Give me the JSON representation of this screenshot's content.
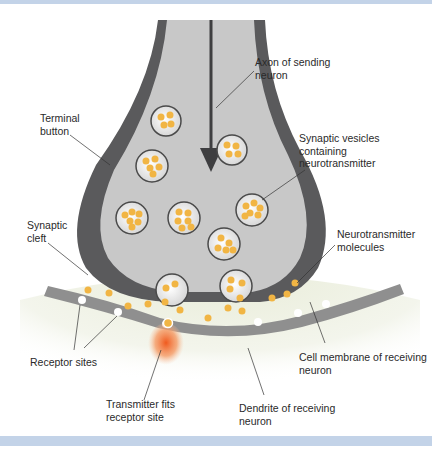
{
  "figure": {
    "colors": {
      "band": "#c3d3e8",
      "membrane_dark": "#5a5a5c",
      "cytoplasm": "#c8c8c8",
      "vesicle_fill": "#eeeeee",
      "vesicle_border": "#4a4a4a",
      "neurotransmitter": "#f1b544",
      "dendrite": "#eef1e4",
      "receiving_membrane": "#8f8f8f",
      "receptor_glow": "#f07a3a"
    }
  },
  "labels": {
    "axon": "Axon of sending\nneuron",
    "terminal_button": "Terminal\nbutton",
    "synaptic_vesicles": "Synaptic vesicles\ncontaining\nneurotransmitter",
    "synaptic_cleft": "Synaptic\ncleft",
    "neurotransmitter_molecules": "Neurotransmitter\nmolecules",
    "receptor_sites": "Receptor sites",
    "cell_membrane": "Cell membrane of receiving\nneuron",
    "transmitter_fits": "Transmitter fits\nreceptor site",
    "dendrite": "Dendrite of receiving\nneuron"
  }
}
